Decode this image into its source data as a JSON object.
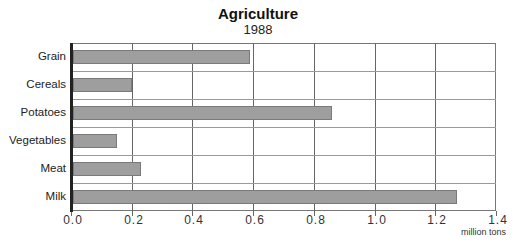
{
  "chart_data": {
    "type": "bar",
    "orientation": "horizontal",
    "title": "Agriculture",
    "subtitle": "1988",
    "categories": [
      "Grain",
      "Cereals",
      "Potatoes",
      "Vegetables",
      "Meat",
      "Milk"
    ],
    "values": [
      0.59,
      0.2,
      0.86,
      0.15,
      0.23,
      1.27
    ],
    "xlabel": "million tons",
    "ylabel": "",
    "xlim": [
      0.0,
      1.4
    ],
    "xticks": [
      "0.0",
      "0.2",
      "0.4",
      "0.6",
      "0.8",
      "1.0",
      "1.2",
      "1.4"
    ],
    "grid": true,
    "legend": null,
    "bar_color": "#9e9e9e"
  }
}
